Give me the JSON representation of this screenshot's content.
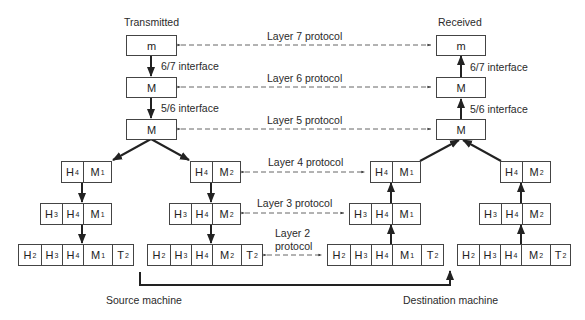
{
  "diagram": {
    "type": "OSI layered message encapsulation",
    "headings": {
      "left": "Transmitted",
      "right": "Received"
    },
    "footers": {
      "left": "Source machine",
      "right": "Destination machine"
    },
    "interfaces": {
      "i67": "6/7 interface",
      "i56": "5/6 interface"
    },
    "protocols": {
      "l7": "Layer 7 protocol",
      "l6": "Layer 6 protocol",
      "l5": "Layer 5 protocol",
      "l4": "Layer 4 protocol",
      "l3": "Layer 3 protocol",
      "l2a": "Layer 2",
      "l2b": "protocol"
    },
    "top_boxes": {
      "m": "m",
      "M": "M"
    },
    "stacks": {
      "src1": {
        "l4": [
          [
            "H",
            "4"
          ],
          [
            "M",
            "1"
          ]
        ],
        "l3": [
          [
            "H",
            "3"
          ],
          [
            "H",
            "4"
          ],
          [
            "M",
            "1"
          ]
        ],
        "l2": [
          [
            "H",
            "2"
          ],
          [
            "H",
            "3"
          ],
          [
            "H",
            "4"
          ],
          [
            "M",
            "1"
          ],
          [
            "T",
            "2"
          ]
        ]
      },
      "src2": {
        "l4": [
          [
            "H",
            "4"
          ],
          [
            "M",
            "2"
          ]
        ],
        "l3": [
          [
            "H",
            "3"
          ],
          [
            "H",
            "4"
          ],
          [
            "M",
            "2"
          ]
        ],
        "l2": [
          [
            "H",
            "2"
          ],
          [
            "H",
            "3"
          ],
          [
            "H",
            "4"
          ],
          [
            "M",
            "2"
          ],
          [
            "T",
            "2"
          ]
        ]
      },
      "dst1": {
        "l4": [
          [
            "H",
            "4"
          ],
          [
            "M",
            "1"
          ]
        ],
        "l3": [
          [
            "H",
            "3"
          ],
          [
            "H",
            "4"
          ],
          [
            "M",
            "1"
          ]
        ],
        "l2": [
          [
            "H",
            "2"
          ],
          [
            "H",
            "3"
          ],
          [
            "H",
            "4"
          ],
          [
            "M",
            "1"
          ],
          [
            "T",
            "2"
          ]
        ]
      },
      "dst2": {
        "l4": [
          [
            "H",
            "4"
          ],
          [
            "M",
            "2"
          ]
        ],
        "l3": [
          [
            "H",
            "3"
          ],
          [
            "H",
            "4"
          ],
          [
            "M",
            "2"
          ]
        ],
        "l2": [
          [
            "H",
            "2"
          ],
          [
            "H",
            "3"
          ],
          [
            "H",
            "4"
          ],
          [
            "M",
            "2"
          ],
          [
            "T",
            "2"
          ]
        ]
      }
    }
  }
}
